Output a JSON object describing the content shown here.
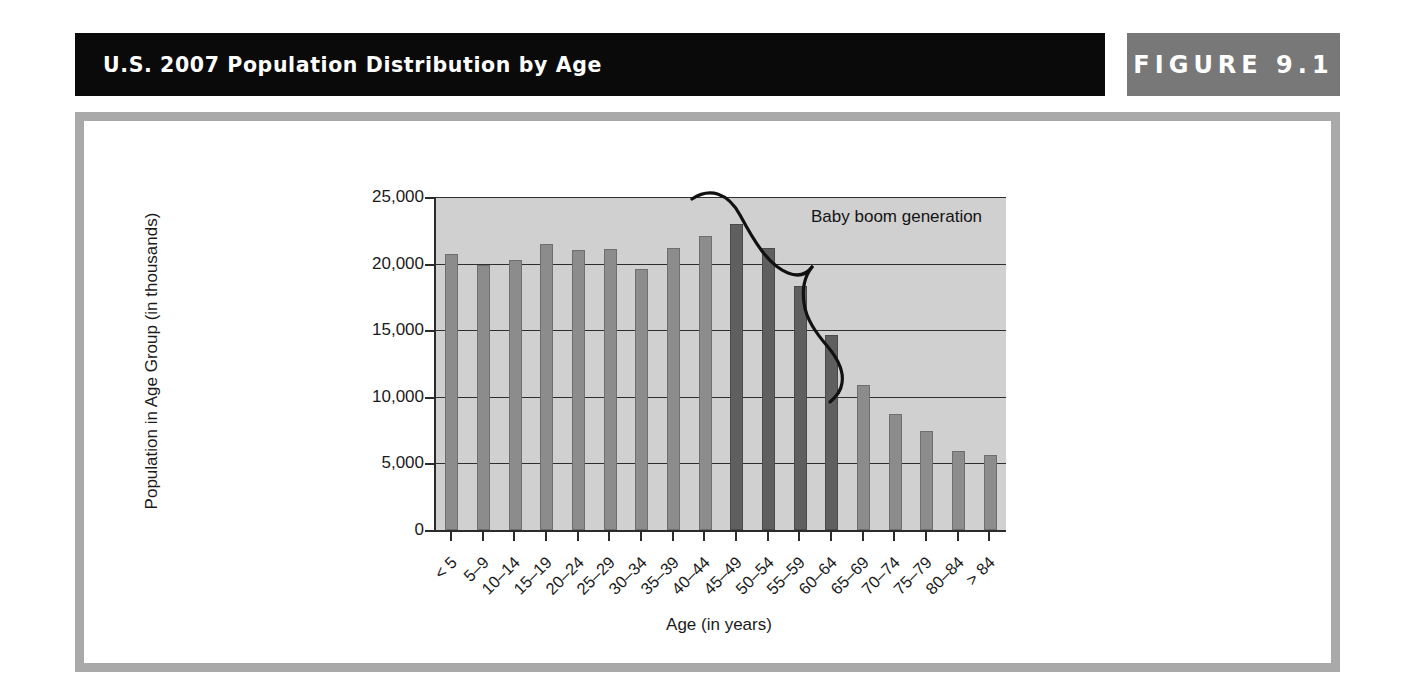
{
  "header": {
    "title": "U.S. 2007 Population Distribution by Age",
    "figure_label": "FIGURE 9.1"
  },
  "colors": {
    "title_bar_bg": "#0a0a0a",
    "figure_tab_bg": "#787878",
    "frame_border": "#a9a9a9",
    "plot_bg": "#d0d0d0",
    "bar_regular": "#8c8c8c",
    "bar_babyboom": "#5f5f5f",
    "axis": "#2b2b2b",
    "text": "#1b1b1b"
  },
  "chart_data": {
    "type": "bar",
    "title": "U.S. 2007 Population Distribution by Age",
    "xlabel": "Age (in years)",
    "ylabel": "Population in Age Group (in thousands)",
    "ylim": [
      0,
      25000
    ],
    "yticks": [
      0,
      5000,
      10000,
      15000,
      20000,
      25000
    ],
    "ytick_labels": [
      "0",
      "5,000",
      "10,000",
      "15,000",
      "20,000",
      "25,000"
    ],
    "grid": true,
    "legend": "none",
    "categories": [
      "< 5",
      "5–9",
      "10–14",
      "15–19",
      "20–24",
      "25–29",
      "30–34",
      "35–39",
      "40–44",
      "45–49",
      "50–54",
      "55–59",
      "60–64",
      "65–69",
      "70–74",
      "75–79",
      "80–84",
      "> 84"
    ],
    "values": [
      20700,
      19900,
      20300,
      21500,
      21050,
      21100,
      19600,
      21200,
      22100,
      22950,
      21150,
      18350,
      14650,
      10900,
      8700,
      7450,
      5900,
      5650
    ],
    "highlight_indices": [
      9,
      10,
      11,
      12
    ],
    "annotations": [
      {
        "text": "Baby boom generation",
        "target_categories": [
          "45–49",
          "50–54",
          "55–59",
          "60–64"
        ]
      }
    ]
  }
}
